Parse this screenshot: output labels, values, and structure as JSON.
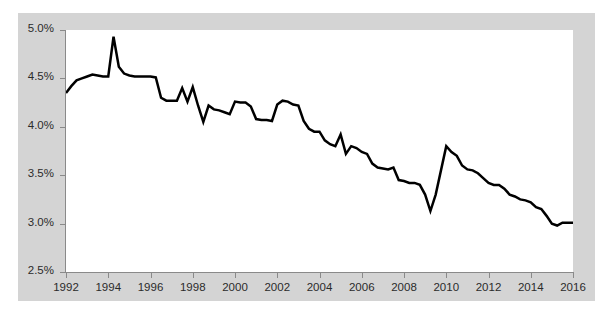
{
  "chart_data": {
    "type": "line",
    "title": "",
    "subtitle": "",
    "xlabel": "",
    "ylabel": "",
    "xlim": [
      1992,
      2016
    ],
    "ylim": [
      2.5,
      5.0
    ],
    "grid": false,
    "legend": null,
    "y_tick_labels": [
      "5.0%",
      "4.5%",
      "4.0%",
      "3.5%",
      "3.0%",
      "2.5%"
    ],
    "y_ticks": [
      5.0,
      4.5,
      4.0,
      3.5,
      3.0,
      2.5
    ],
    "x_tick_labels": [
      "1992",
      "1994",
      "1996",
      "1998",
      "2000",
      "2002",
      "2004",
      "2006",
      "2008",
      "2010",
      "2012",
      "2014",
      "2016"
    ],
    "x_ticks": [
      1992,
      1994,
      1996,
      1998,
      2000,
      2002,
      2004,
      2006,
      2008,
      2010,
      2012,
      2014,
      2016
    ],
    "line_color": "#000000",
    "line_width": 2.5,
    "plot_background": "#ffffff",
    "frame_background": "#d4d4d4",
    "series": [
      {
        "name": "series-1",
        "x": [
          1992.0,
          1992.25,
          1992.5,
          1992.75,
          1993.0,
          1993.25,
          1993.5,
          1993.75,
          1994.0,
          1994.25,
          1994.5,
          1994.75,
          1995.0,
          1995.25,
          1995.5,
          1995.75,
          1996.0,
          1996.25,
          1996.5,
          1996.75,
          1997.0,
          1997.25,
          1997.5,
          1997.75,
          1998.0,
          1998.25,
          1998.5,
          1998.75,
          1999.0,
          1999.25,
          1999.5,
          1999.75,
          2000.0,
          2000.25,
          2000.5,
          2000.75,
          2001.0,
          2001.25,
          2001.5,
          2001.75,
          2002.0,
          2002.25,
          2002.5,
          2002.75,
          2003.0,
          2003.25,
          2003.5,
          2003.75,
          2004.0,
          2004.25,
          2004.5,
          2004.75,
          2005.0,
          2005.25,
          2005.5,
          2005.75,
          2006.0,
          2006.25,
          2006.5,
          2006.75,
          2007.0,
          2007.25,
          2007.5,
          2007.75,
          2008.0,
          2008.25,
          2008.5,
          2008.75,
          2009.0,
          2009.25,
          2009.5,
          2009.75,
          2010.0,
          2010.25,
          2010.5,
          2010.75,
          2011.0,
          2011.25,
          2011.5,
          2011.75,
          2012.0,
          2012.25,
          2012.5,
          2012.75,
          2013.0,
          2013.25,
          2013.5,
          2013.75,
          2014.0,
          2014.25,
          2014.5,
          2014.75,
          2015.0,
          2015.25,
          2015.5,
          2015.75,
          2016.0
        ],
        "values": [
          4.35,
          4.42,
          4.48,
          4.5,
          4.52,
          4.54,
          4.53,
          4.52,
          4.52,
          4.93,
          4.62,
          4.55,
          4.53,
          4.52,
          4.52,
          4.52,
          4.52,
          4.51,
          4.3,
          4.27,
          4.27,
          4.27,
          4.4,
          4.26,
          4.41,
          4.22,
          4.05,
          4.22,
          4.18,
          4.17,
          4.15,
          4.13,
          4.26,
          4.25,
          4.25,
          4.21,
          4.08,
          4.07,
          4.07,
          4.06,
          4.23,
          4.27,
          4.26,
          4.23,
          4.22,
          4.06,
          3.98,
          3.95,
          3.95,
          3.86,
          3.82,
          3.8,
          3.92,
          3.72,
          3.8,
          3.78,
          3.74,
          3.72,
          3.62,
          3.58,
          3.57,
          3.56,
          3.58,
          3.45,
          3.44,
          3.42,
          3.42,
          3.4,
          3.3,
          3.13,
          3.3,
          3.55,
          3.8,
          3.74,
          3.7,
          3.6,
          3.56,
          3.55,
          3.52,
          3.47,
          3.42,
          3.4,
          3.4,
          3.36,
          3.3,
          3.28,
          3.25,
          3.24,
          3.22,
          3.17,
          3.15,
          3.08,
          3.0,
          2.98,
          3.01,
          3.01,
          3.01
        ]
      }
    ]
  }
}
